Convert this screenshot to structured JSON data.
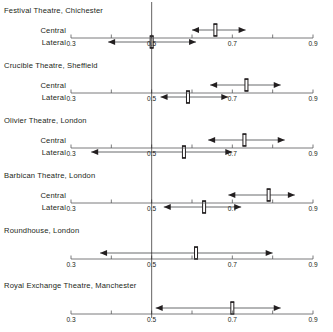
{
  "figure": {
    "type": "forest-plot",
    "background": "#ffffff",
    "line_color": "#58595b",
    "marker_color": "#231f20",
    "reference_value": 0.5,
    "reference_line_visible": true,
    "grid": false,
    "legend": "none"
  },
  "axis": {
    "min": 0.3,
    "max": 0.9,
    "tick_values": [
      0.3,
      0.4,
      0.5,
      0.6,
      0.7,
      0.8,
      0.9
    ],
    "tick_labels": [
      "0.3",
      "",
      "0.5",
      "",
      "0.7",
      "",
      "0.9"
    ],
    "xlabel": "",
    "ylabel": ""
  },
  "row_labels": {
    "central": "Central",
    "lateral": "Lateral"
  },
  "panels": [
    {
      "title": "Festival Theatre, Chichester",
      "rows": [
        {
          "label": "Central",
          "estimate": 0.658,
          "ci_low": 0.6,
          "ci_high": 0.733,
          "low_arrow": true,
          "high_arrow": true
        },
        {
          "label": "Lateral",
          "estimate": 0.5,
          "ci_low": 0.392,
          "ci_high": 0.61,
          "low_arrow": true,
          "high_arrow": true
        }
      ]
    },
    {
      "title": "Crucible Theatre, Sheffield",
      "rows": [
        {
          "label": "Central",
          "estimate": 0.735,
          "ci_low": 0.645,
          "ci_high": 0.82,
          "low_arrow": true,
          "high_arrow": true
        },
        {
          "label": "Lateral",
          "estimate": 0.59,
          "ci_low": 0.522,
          "ci_high": 0.69,
          "low_arrow": true,
          "high_arrow": true
        }
      ]
    },
    {
      "title": "Olivier Theatre, London",
      "rows": [
        {
          "label": "Central",
          "estimate": 0.73,
          "ci_low": 0.64,
          "ci_high": 0.83,
          "low_arrow": true,
          "high_arrow": true
        },
        {
          "label": "Lateral",
          "estimate": 0.58,
          "ci_low": 0.35,
          "ci_high": 0.7,
          "low_arrow": true,
          "high_arrow": true
        }
      ]
    },
    {
      "title": "Barbican Theatre, London",
      "rows": [
        {
          "label": "Central",
          "estimate": 0.79,
          "ci_low": 0.69,
          "ci_high": 0.855,
          "low_arrow": true,
          "high_arrow": true
        },
        {
          "label": "Lateral",
          "estimate": 0.63,
          "ci_low": 0.53,
          "ci_high": 0.722,
          "low_arrow": true,
          "high_arrow": true
        }
      ]
    },
    {
      "title": "Roundhouse, London",
      "rows": [
        {
          "label": "",
          "estimate": 0.61,
          "ci_low": 0.372,
          "ci_high": 0.8,
          "low_arrow": true,
          "high_arrow": true
        }
      ]
    },
    {
      "title": "Royal Exchange Theatre, Manchester",
      "rows": [
        {
          "label": "",
          "estimate": 0.7,
          "ci_low": 0.51,
          "ci_high": 0.82,
          "low_arrow": true,
          "high_arrow": true
        }
      ]
    }
  ],
  "chart_data": {
    "type": "forest",
    "title": "",
    "xlabel": "",
    "ylabel": "",
    "xlim": [
      0.3,
      0.9
    ],
    "xticks": [
      0.3,
      0.4,
      0.5,
      0.6,
      0.7,
      0.8,
      0.9
    ],
    "xticklabels": [
      "0.3",
      "",
      "0.5",
      "",
      "0.7",
      "",
      "0.9"
    ],
    "grid": false,
    "reference_line": 0.5,
    "legend_position": "none",
    "groups": [
      {
        "name": "Festival Theatre, Chichester",
        "series": [
          {
            "name": "Central",
            "estimate": 0.658,
            "ci": [
              0.6,
              0.733
            ]
          },
          {
            "name": "Lateral",
            "estimate": 0.5,
            "ci": [
              0.392,
              0.61
            ]
          }
        ]
      },
      {
        "name": "Crucible Theatre, Sheffield",
        "series": [
          {
            "name": "Central",
            "estimate": 0.735,
            "ci": [
              0.645,
              0.82
            ]
          },
          {
            "name": "Lateral",
            "estimate": 0.59,
            "ci": [
              0.522,
              0.69
            ]
          }
        ]
      },
      {
        "name": "Olivier Theatre, London",
        "series": [
          {
            "name": "Central",
            "estimate": 0.73,
            "ci": [
              0.64,
              0.83
            ]
          },
          {
            "name": "Lateral",
            "estimate": 0.58,
            "ci": [
              0.35,
              0.7
            ]
          }
        ]
      },
      {
        "name": "Barbican Theatre, London",
        "series": [
          {
            "name": "Central",
            "estimate": 0.79,
            "ci": [
              0.69,
              0.855
            ]
          },
          {
            "name": "Lateral",
            "estimate": 0.63,
            "ci": [
              0.53,
              0.722
            ]
          }
        ]
      },
      {
        "name": "Roundhouse, London",
        "series": [
          {
            "name": "",
            "estimate": 0.61,
            "ci": [
              0.372,
              0.8
            ]
          }
        ]
      },
      {
        "name": "Royal Exchange Theatre, Manchester",
        "series": [
          {
            "name": "",
            "estimate": 0.7,
            "ci": [
              0.51,
              0.82
            ]
          }
        ]
      }
    ]
  }
}
